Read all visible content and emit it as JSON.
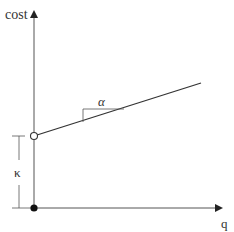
{
  "diagram": {
    "type": "cost-function",
    "axes": {
      "y_label": "cost",
      "x_label": "q"
    },
    "annotations": {
      "slope_label": "α",
      "intercept_label": "κ"
    },
    "points": {
      "intercept_open": "open circle at (0, κ)",
      "origin_filled": "filled dot at origin"
    },
    "colors": {
      "stroke": "#333333",
      "axis": "#555555",
      "background": "#ffffff"
    }
  }
}
